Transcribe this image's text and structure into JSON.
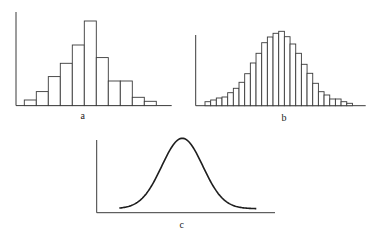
{
  "figure": {
    "panels": [
      {
        "id": "a",
        "label": "a",
        "type": "histogram",
        "bins": 11,
        "bar_heights_px": [
          5.6,
          14,
          29,
          42.3,
          60.6,
          84.6,
          48,
          24.6,
          24.6,
          8.3,
          4.3
        ]
      },
      {
        "id": "b",
        "label": "b",
        "type": "histogram",
        "bins": 26,
        "bar_heights_px": [
          4,
          5.7,
          7.7,
          8.7,
          13,
          17.4,
          23.4,
          32,
          42.7,
          52.4,
          63,
          68.7,
          72.4,
          74.4,
          69,
          61.7,
          52.4,
          41.4,
          32.4,
          22.4,
          14,
          10.7,
          6.7,
          6.7,
          4,
          2.4
        ]
      },
      {
        "id": "c",
        "label": "c",
        "type": "normal-curve"
      }
    ]
  },
  "chart_data": [
    {
      "type": "bar",
      "title": "a",
      "xlabel": "a",
      "ylabel": "",
      "categories": [
        "1",
        "2",
        "3",
        "4",
        "5",
        "6",
        "7",
        "8",
        "9",
        "10",
        "11"
      ],
      "values": [
        2,
        5,
        10,
        15,
        21,
        30,
        17,
        9,
        9,
        3,
        1.5
      ],
      "grid": false,
      "note": "Coarse histogram approximating a bell shape; relative frequencies (no axis ticks shown)"
    },
    {
      "type": "bar",
      "title": "b",
      "xlabel": "b",
      "ylabel": "",
      "categories": [
        "1",
        "2",
        "3",
        "4",
        "5",
        "6",
        "7",
        "8",
        "9",
        "10",
        "11",
        "12",
        "13",
        "14",
        "15",
        "16",
        "17",
        "18",
        "19",
        "20",
        "21",
        "22",
        "23",
        "24",
        "25",
        "26"
      ],
      "values": [
        4,
        6,
        8,
        9,
        13,
        17,
        23,
        32,
        43,
        52,
        63,
        69,
        72,
        74,
        69,
        62,
        52,
        41,
        32,
        22,
        14,
        11,
        7,
        7,
        4,
        2
      ],
      "grid": false,
      "note": "Finer histogram approximating a bell shape; relative frequencies (no axis ticks shown)"
    },
    {
      "type": "line",
      "title": "c",
      "xlabel": "c",
      "ylabel": "",
      "series": [
        {
          "name": "normal density",
          "shape": "bell curve (normal distribution)"
        }
      ],
      "grid": false
    }
  ]
}
